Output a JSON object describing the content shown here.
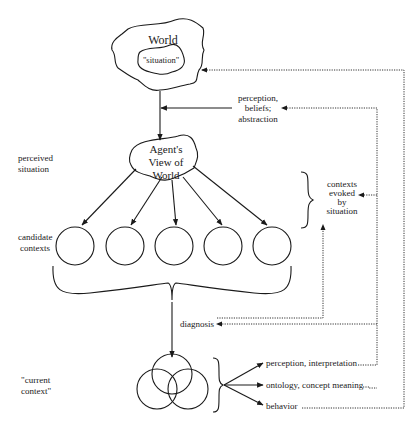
{
  "diagram": {
    "world": {
      "title": "World",
      "inner_label": "\"situation\""
    },
    "perception_box": {
      "line1": "perception,",
      "line2": "beliefs;",
      "line3": "abstraction"
    },
    "agent_view": {
      "line1": "Agent's",
      "line2": "View of",
      "line3": "World"
    },
    "left_labels": {
      "perceived_line1": "perceived",
      "perceived_line2": "situation",
      "candidate_line1": "candidate",
      "candidate_line2": "contexts",
      "current_line1": "\"current",
      "current_line2": "context\""
    },
    "contexts_evoked": {
      "line1": "contexts",
      "line2": "evoked",
      "line3": "by",
      "line4": "situation"
    },
    "candidate_count": 5,
    "diagnosis_label": "diagnosis",
    "outputs": [
      {
        "label": "perception, interpretation"
      },
      {
        "label": "ontology, concept meaning"
      },
      {
        "label": "behavior"
      }
    ]
  }
}
